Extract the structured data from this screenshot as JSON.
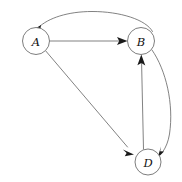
{
  "diagram": {
    "type": "directed-graph",
    "background_color": "#ffffff",
    "stroke_color": "#6b6b6b",
    "arrow_color": "#1a1a1a",
    "label_color": "#111111",
    "nodes": [
      {
        "id": "A",
        "label": "A",
        "cx": 36,
        "cy": 41,
        "r": 13.5
      },
      {
        "id": "B",
        "label": "B",
        "cx": 141,
        "cy": 41,
        "r": 13.5
      },
      {
        "id": "D",
        "label": "D",
        "cx": 148,
        "cy": 162,
        "r": 13.0
      }
    ],
    "edges": [
      {
        "id": "a-to-b",
        "from": "A",
        "to": "B",
        "shape": "straight",
        "label": ""
      },
      {
        "id": "a-to-d",
        "from": "A",
        "to": "D",
        "shape": "straight",
        "label": ""
      },
      {
        "id": "d-to-b",
        "from": "D",
        "to": "B",
        "shape": "straight",
        "label": ""
      },
      {
        "id": "b-to-d",
        "from": "B",
        "to": "D",
        "shape": "curved-right",
        "label": ""
      },
      {
        "id": "b-to-a",
        "from": "B",
        "to": "A",
        "shape": "curved-top",
        "label": ""
      }
    ]
  }
}
